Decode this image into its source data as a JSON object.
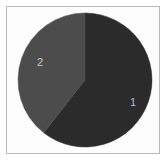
{
  "chart_data": {
    "type": "pie",
    "title": "",
    "subtitle": "",
    "xlabel": "",
    "ylabel": "",
    "grid": false,
    "legend_position": "none",
    "labels_inside": true,
    "start_angle_deg": 0,
    "direction": "clockwise",
    "categories": [
      "1",
      "2"
    ],
    "values": [
      60,
      40
    ],
    "slices": [
      {
        "label": "1",
        "value": 60,
        "percent": 60,
        "color": "#2b2b2b",
        "start_angle_deg": 0,
        "end_angle_deg": 218,
        "label_color": "#bdbdbd"
      },
      {
        "label": "2",
        "value": 40,
        "percent": 40,
        "color": "#4c4c4c",
        "start_angle_deg": 218,
        "end_angle_deg": 360,
        "label_color": "#c9c9c9"
      }
    ],
    "colors": [
      "#2b2b2b",
      "#4c4c4c"
    ],
    "tick_labels": [],
    "annotations": []
  },
  "figure": {
    "background_color": "#ffffff",
    "plot_area_background": "#fdfdfd",
    "border_color": "#b9b9b9",
    "pie_center_x": 85,
    "pie_center_y": 80,
    "pie_radius": 67
  }
}
